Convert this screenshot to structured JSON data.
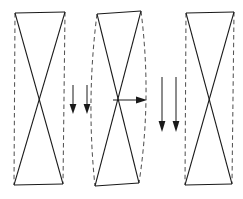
{
  "figure": {
    "width": 243,
    "height": 199,
    "background_color": "#ffffff",
    "solid_stroke_color": "#1a1a1a",
    "dashed_stroke_color": "#555555"
  },
  "panels": [
    {
      "id": "panel-left",
      "label": "undeformed-panel-left",
      "state": "undeformed",
      "top_edge": {
        "x1": 15,
        "y1": 13,
        "x2": 65,
        "y2": 12
      },
      "bottom_edge": {
        "x1": 14,
        "y1": 185,
        "x2": 63,
        "y2": 184
      },
      "left_side": {
        "type": "dashed-straight",
        "x1": 15,
        "y1": 13,
        "x2": 14,
        "y2": 185
      },
      "right_side": {
        "type": "dashed-straight",
        "x1": 65,
        "y1": 12,
        "x2": 63,
        "y2": 184
      },
      "brace_a": {
        "x1": 15,
        "y1": 13,
        "x2": 63,
        "y2": 184
      },
      "brace_b": {
        "x1": 65,
        "y1": 12,
        "x2": 14,
        "y2": 185
      }
    },
    {
      "id": "panel-middle",
      "label": "buckled-panel-middle",
      "state": "buckled",
      "top_edge": {
        "x1": 97,
        "y1": 14,
        "x2": 141,
        "y2": 11
      },
      "bottom_edge": {
        "x1": 95,
        "y1": 186,
        "x2": 139,
        "y2": 183
      },
      "left_side": {
        "type": "dashed-curve",
        "x1": 97,
        "y1": 14,
        "cx": 88,
        "cy": 100,
        "x2": 95,
        "y2": 186
      },
      "right_side": {
        "type": "dashed-curve",
        "x1": 141,
        "y1": 11,
        "cx": 150,
        "cy": 98,
        "x2": 139,
        "y2": 183
      },
      "brace_a": {
        "x1": 97,
        "y1": 14,
        "x2": 139,
        "y2": 183
      },
      "brace_b": {
        "x1": 141,
        "y1": 11,
        "x2": 95,
        "y2": 186
      }
    },
    {
      "id": "panel-right",
      "label": "undeformed-panel-right",
      "state": "undeformed",
      "top_edge": {
        "x1": 186,
        "y1": 13,
        "x2": 234,
        "y2": 12
      },
      "bottom_edge": {
        "x1": 185,
        "y1": 185,
        "x2": 232,
        "y2": 184
      },
      "left_side": {
        "type": "dashed-straight",
        "x1": 186,
        "y1": 13,
        "x2": 185,
        "y2": 185
      },
      "right_side": {
        "type": "dashed-straight",
        "x1": 234,
        "y1": 12,
        "x2": 232,
        "y2": 184
      },
      "brace_a": {
        "x1": 186,
        "y1": 13,
        "x2": 232,
        "y2": 184
      },
      "brace_b": {
        "x1": 234,
        "y1": 12,
        "x2": 185,
        "y2": 185
      }
    }
  ],
  "arrows": [
    {
      "id": "load-arrow-left-1",
      "label": "downward-load-arrow",
      "direction": "down",
      "x1": 73,
      "y1": 85,
      "x2": 73,
      "y2": 113
    },
    {
      "id": "load-arrow-left-2",
      "label": "downward-load-arrow",
      "direction": "down",
      "x1": 87,
      "y1": 85,
      "x2": 87,
      "y2": 113
    },
    {
      "id": "lateral-arrow-middle",
      "label": "lateral-displacement-arrow",
      "direction": "right",
      "x1": 113,
      "y1": 100,
      "x2": 146,
      "y2": 100
    },
    {
      "id": "load-arrow-right-1",
      "label": "downward-load-arrow",
      "direction": "down",
      "x1": 162,
      "y1": 77,
      "x2": 162,
      "y2": 131
    },
    {
      "id": "load-arrow-right-2",
      "label": "downward-load-arrow",
      "direction": "down",
      "x1": 176,
      "y1": 77,
      "x2": 176,
      "y2": 131
    }
  ]
}
